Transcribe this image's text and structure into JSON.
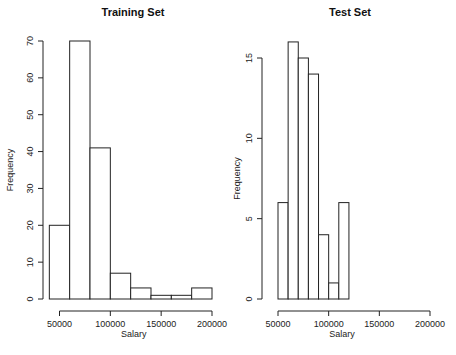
{
  "chart_data": [
    {
      "type": "bar",
      "subtype": "histogram",
      "title": "Training Set",
      "xlabel": "Salary",
      "ylabel": "Frequency",
      "bin_edges": [
        40000,
        60000,
        80000,
        100000,
        120000,
        140000,
        160000,
        180000,
        200000
      ],
      "values": [
        20,
        70,
        41,
        7,
        3,
        1,
        1,
        3
      ],
      "x_ticks": [
        "50000",
        "100000",
        "150000",
        "200000"
      ],
      "x_tick_values": [
        50000,
        100000,
        150000,
        200000
      ],
      "y_ticks": [
        "0",
        "10",
        "20",
        "30",
        "40",
        "50",
        "60",
        "70"
      ],
      "y_tick_values": [
        0,
        10,
        20,
        30,
        40,
        50,
        60,
        70
      ],
      "xlim": [
        40000,
        200000
      ],
      "ylim": [
        0,
        70
      ],
      "grid": false
    },
    {
      "type": "bar",
      "subtype": "histogram",
      "title": "Test Set",
      "xlabel": "Salary",
      "ylabel": "Frequency",
      "bin_edges": [
        50000,
        60000,
        70000,
        80000,
        90000,
        100000,
        110000,
        120000
      ],
      "values": [
        6,
        16,
        15,
        14,
        4,
        1,
        6
      ],
      "x_ticks": [
        "50000",
        "100000",
        "150000",
        "200000"
      ],
      "x_tick_values": [
        50000,
        100000,
        150000,
        200000
      ],
      "y_ticks": [
        "0",
        "5",
        "10",
        "15"
      ],
      "y_tick_values": [
        0,
        5,
        10,
        15
      ],
      "xlim": [
        50000,
        200000
      ],
      "ylim": [
        0,
        16
      ],
      "grid": false
    }
  ]
}
